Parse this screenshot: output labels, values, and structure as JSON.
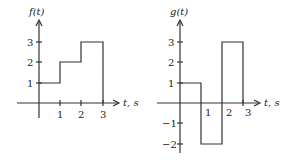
{
  "graphs": [
    {
      "id": "f",
      "y_label": "f(t)",
      "x_label": "t, s",
      "x_ticks": [
        "1",
        "2",
        "3"
      ],
      "y_ticks": [
        "1",
        "2",
        "3"
      ],
      "segments": [
        {
          "t_start": 0,
          "t_end": 1,
          "value": 1
        },
        {
          "t_start": 1,
          "t_end": 2,
          "value": 2
        },
        {
          "t_start": 2,
          "t_end": 3,
          "value": 3
        }
      ]
    },
    {
      "id": "g",
      "y_label": "g(t)",
      "x_label": "t, s",
      "x_ticks": [
        "1",
        "2",
        "3"
      ],
      "y_ticks": [
        "3",
        "2",
        "1",
        "−1",
        "−2"
      ],
      "segments": [
        {
          "t_start": 0,
          "t_end": 1,
          "value": 1
        },
        {
          "t_start": 1,
          "t_end": 2,
          "value": -2
        },
        {
          "t_start": 2,
          "t_end": 3,
          "value": 3
        }
      ]
    }
  ],
  "colors": {
    "line": "#333333",
    "text": "#222222",
    "background": "#ffffff"
  }
}
